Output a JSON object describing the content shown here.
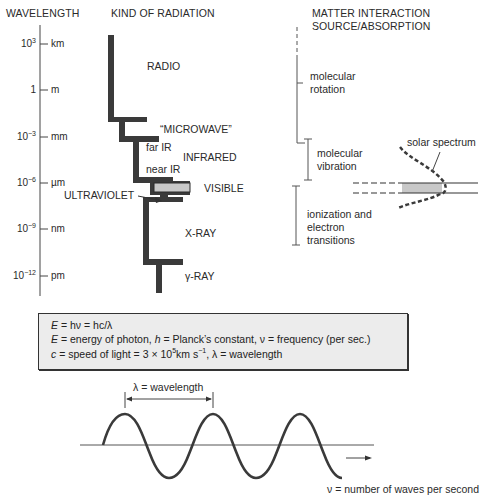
{
  "headers": {
    "wavelength": "WAVELENGTH",
    "kind": "KIND OF RADIATION",
    "matter_line1": "MATTER INTERACTION",
    "matter_line2": "SOURCE/ABSORPTION"
  },
  "wavelength_axis": {
    "ticks": [
      {
        "base": "10",
        "exp": "3",
        "unit": "km"
      },
      {
        "base": "1",
        "exp": "",
        "unit": "m"
      },
      {
        "base": "10",
        "exp": "−3",
        "unit": "mm"
      },
      {
        "base": "10",
        "exp": "−6",
        "unit": "µm"
      },
      {
        "base": "10",
        "exp": "−9",
        "unit": "nm"
      },
      {
        "base": "10",
        "exp": "−12",
        "unit": "pm"
      }
    ]
  },
  "radiation_labels": {
    "radio": "RADIO",
    "microwave": "“MICROWAVE”",
    "far_ir": "far IR",
    "infrared": "INFRARED",
    "near_ir": "near IR",
    "visible": "VISIBLE",
    "ultraviolet": "ULTRAVIOLET",
    "xray": "X-RAY",
    "gamma": "γ-RAY"
  },
  "interaction_labels": {
    "rotation_1": "molecular",
    "rotation_2": "rotation",
    "vibration_1": "molecular",
    "vibration_2": "vibration",
    "ionization_1": "ionization and",
    "ionization_2": "electron",
    "ionization_3": "transitions",
    "solar": "solar spectrum"
  },
  "equations": {
    "line1_E": "E",
    "line1_rest": " = hν = hc/λ",
    "line2_E": "E",
    "line2_a": " = energy of photon, ",
    "line2_h": "h",
    "line2_b": " = Planck’s constant, ν = frequency (per sec.)",
    "line3_c": "c",
    "line3_a": " = speed of light = 3 × 10",
    "line3_exp1": "5",
    "line3_b": "km s",
    "line3_exp2": "−1",
    "line3_c2": ", λ = wavelength"
  },
  "wave": {
    "wavelength_label": "λ = wavelength",
    "frequency_label": "ν = number of waves per second"
  },
  "colors": {
    "bar": "#3a3a3a",
    "visible_fill": "#c8c8c8",
    "box_fill": "#ececec"
  }
}
